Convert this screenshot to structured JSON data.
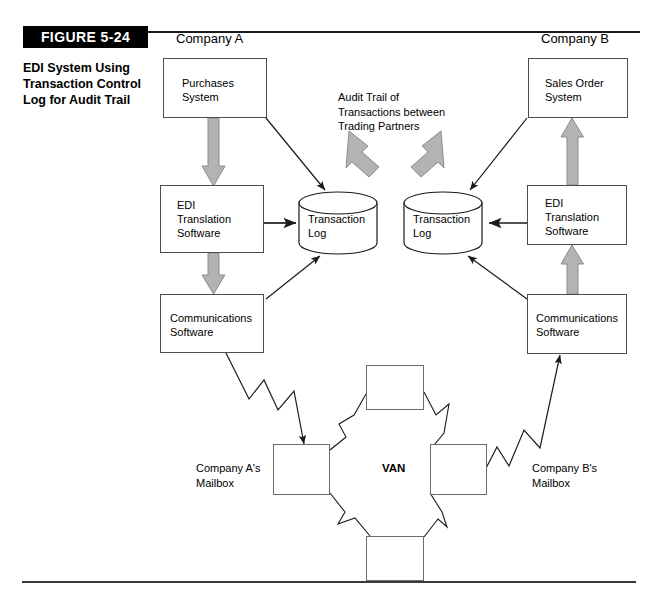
{
  "figure": {
    "badge": "FIGURE 5-24",
    "caption": "EDI System Using\nTransaction Control\nLog for Audit Trail"
  },
  "labels": {
    "company_a": "Company A",
    "company_b": "Company B",
    "van": "VAN",
    "mailbox_a": "Company A's\nMailbox",
    "mailbox_b": "Company B's\nMailbox",
    "audit_note": "Audit Trail of\nTransactions between\nTrading Partners"
  },
  "nodes": {
    "purchases_system": "Purchases\nSystem",
    "edi_translation_a": "EDI\nTranslation\nSoftware",
    "communications_a": "Communications\nSoftware",
    "transaction_log_a": "Transaction\nLog",
    "transaction_log_b": "Transaction\nLog",
    "sales_order_system": "Sales Order\nSystem",
    "edi_translation_b": "EDI\nTranslation\nSoftware",
    "communications_b": "Communications\nSoftware"
  },
  "colors": {
    "line": "#1a1a1a",
    "box_border": "#4d4d4d",
    "block_arrow_fill": "#b3b3b3",
    "block_arrow_stroke": "#808080",
    "badge_bg": "#000000",
    "badge_text": "#ffffff",
    "page_bg": "#ffffff"
  }
}
